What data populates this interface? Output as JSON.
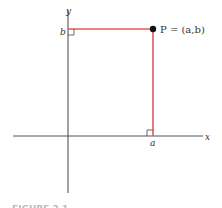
{
  "diagram": {
    "axes": {
      "x_label": "x",
      "y_label": "y",
      "origin": [
        68,
        136
      ],
      "x_axis": {
        "from": 13,
        "to": 203,
        "y": 136
      },
      "y_axis": {
        "from": 10,
        "to": 193,
        "x": 68
      }
    },
    "point": {
      "label": "P = (a,b)",
      "px": [
        153,
        29
      ],
      "color": "#111111"
    },
    "ticks": {
      "a_label": "a",
      "b_label": "b"
    },
    "projection_color": "#e05a5a",
    "axis_color": "#444444",
    "caption": "FIGURE 2.1"
  }
}
